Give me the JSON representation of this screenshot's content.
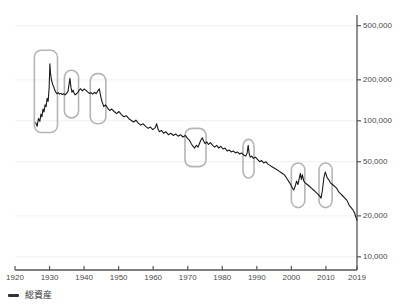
{
  "chart_data": {
    "type": "line",
    "title": "",
    "subtitle": "",
    "xlabel": "",
    "ylabel": "",
    "yscale": "log",
    "xlim": [
      1920,
      2019
    ],
    "ylim": [
      8000,
      560000
    ],
    "grid": true,
    "legend_position": "bottom-left",
    "y_ticks": [
      {
        "value": 500000,
        "label": "500,000"
      },
      {
        "value": 200000,
        "label": "200,000"
      },
      {
        "value": 100000,
        "label": "100,000"
      },
      {
        "value": 50000,
        "label": "50,000"
      },
      {
        "value": 20000,
        "label": "20,000"
      },
      {
        "value": 10000,
        "label": "10,000"
      }
    ],
    "x_ticks": [
      {
        "value": 1920,
        "label": "1920"
      },
      {
        "value": 1930,
        "label": "1930"
      },
      {
        "value": 1940,
        "label": "1940"
      },
      {
        "value": 1950,
        "label": "1950"
      },
      {
        "value": 1960,
        "label": "1960"
      },
      {
        "value": 1970,
        "label": "1970"
      },
      {
        "value": 1980,
        "label": "1980"
      },
      {
        "value": 1990,
        "label": "1990"
      },
      {
        "value": 2000,
        "label": "2000"
      },
      {
        "value": 2010,
        "label": "2010"
      },
      {
        "value": 2019,
        "label": "2019"
      }
    ],
    "series": [
      {
        "name": "総資産",
        "color": "#1a1a1a",
        "x": [
          1926.0,
          1926.4,
          1926.8,
          1927.2,
          1927.5,
          1927.8,
          1928.1,
          1928.4,
          1928.7,
          1929.0,
          1929.3,
          1929.6,
          1929.9,
          1930.1,
          1930.3,
          1930.6,
          1930.9,
          1931.2,
          1931.5,
          1931.8,
          1932.1,
          1932.5,
          1932.9,
          1933.3,
          1933.7,
          1934.1,
          1934.5,
          1934.9,
          1935.3,
          1935.6,
          1935.9,
          1936.2,
          1936.5,
          1936.8,
          1937.1,
          1937.4,
          1937.8,
          1938.2,
          1938.6,
          1939.0,
          1939.5,
          1940.0,
          1940.5,
          1941.0,
          1941.5,
          1942.0,
          1942.5,
          1943.0,
          1943.5,
          1944.0,
          1944.4,
          1944.8,
          1945.2,
          1945.7,
          1946.2,
          1946.8,
          1947.4,
          1948.0,
          1948.7,
          1949.4,
          1950.1,
          1950.8,
          1951.5,
          1952.2,
          1952.9,
          1953.6,
          1954.3,
          1955.0,
          1955.7,
          1956.4,
          1957.1,
          1957.8,
          1958.5,
          1959.2,
          1959.9,
          1960.6,
          1961.0,
          1961.4,
          1961.8,
          1962.4,
          1963.0,
          1963.7,
          1964.4,
          1965.1,
          1965.8,
          1966.5,
          1967.2,
          1967.9,
          1968.6,
          1969.3,
          1970.0,
          1970.5,
          1971.0,
          1971.5,
          1972.0,
          1972.5,
          1973.0,
          1973.4,
          1973.8,
          1974.2,
          1974.6,
          1975.0,
          1975.5,
          1976.0,
          1976.6,
          1977.2,
          1977.8,
          1978.4,
          1979.0,
          1979.6,
          1980.2,
          1980.8,
          1981.4,
          1982.0,
          1982.6,
          1983.2,
          1983.8,
          1984.4,
          1985.0,
          1985.6,
          1986.2,
          1986.8,
          1987.2,
          1987.5,
          1987.8,
          1988.1,
          1988.5,
          1989.0,
          1989.6,
          1990.2,
          1990.8,
          1991.4,
          1992.0,
          1992.6,
          1993.2,
          1993.8,
          1994.4,
          1995.0,
          1995.6,
          1996.2,
          1996.8,
          1997.4,
          1998.0,
          1998.6,
          1999.2,
          1999.8,
          2000.3,
          2000.7,
          2001.1,
          2001.5,
          2001.9,
          2002.3,
          2002.6,
          2002.9,
          2003.2,
          2003.6,
          2004.0,
          2004.6,
          2005.2,
          2005.8,
          2006.4,
          2007.0,
          2007.6,
          2008.2,
          2008.6,
          2009.0,
          2009.4,
          2009.8,
          2010.1,
          2010.4,
          2010.8,
          2011.3,
          2011.9,
          2012.5,
          2013.1,
          2013.7,
          2014.3,
          2014.9,
          2015.5,
          2016.1,
          2016.7,
          2017.3,
          2017.9,
          2018.3,
          2018.7,
          2019.0
        ],
        "y": [
          97000,
          91000,
          104000,
          99000,
          112000,
          107000,
          122000,
          116000,
          131000,
          127000,
          146000,
          139000,
          178000,
          262000,
          221000,
          197000,
          185000,
          178000,
          168000,
          163000,
          158000,
          161000,
          157000,
          159000,
          156000,
          158000,
          155000,
          159000,
          163000,
          182000,
          205000,
          176000,
          162000,
          168000,
          160000,
          155000,
          158000,
          162000,
          168000,
          172000,
          166000,
          171000,
          168000,
          163000,
          159000,
          161000,
          157000,
          162000,
          158000,
          166000,
          172000,
          152000,
          138000,
          127000,
          131000,
          124000,
          119000,
          122000,
          117000,
          113000,
          117000,
          111000,
          107000,
          109000,
          104000,
          101000,
          98000,
          101000,
          96000,
          93000,
          95000,
          91000,
          88000,
          90000,
          86000,
          89000,
          95000,
          87000,
          83000,
          85000,
          81000,
          83000,
          79000,
          81000,
          78000,
          80000,
          77000,
          79000,
          76000,
          78000,
          74000,
          72000,
          68000,
          65000,
          63000,
          66000,
          64000,
          68000,
          72000,
          75000,
          71000,
          68000,
          70000,
          67000,
          69000,
          66000,
          64000,
          66000,
          63000,
          65000,
          62000,
          63000,
          60000,
          61000,
          59000,
          60000,
          58000,
          59000,
          57000,
          58000,
          56000,
          55000,
          58000,
          66000,
          57000,
          54000,
          55000,
          53000,
          54000,
          52000,
          50000,
          51000,
          49000,
          50000,
          48000,
          47000,
          46000,
          45000,
          44000,
          43000,
          42000,
          41000,
          40000,
          38000,
          36000,
          34000,
          32000,
          31000,
          33000,
          36000,
          34000,
          38000,
          41000,
          37000,
          40000,
          36000,
          35000,
          34000,
          33000,
          32000,
          31000,
          30000,
          29000,
          28000,
          27000,
          31000,
          38000,
          42000,
          40000,
          38000,
          37000,
          35000,
          34000,
          33000,
          32000,
          30000,
          29000,
          28000,
          27000,
          26000,
          24000,
          23000,
          22000,
          21000,
          19500,
          18600
        ]
      }
    ],
    "annotations": [
      {
        "name": "highlight-1926-1932",
        "x_start": 1925.6,
        "x_end": 1932.3,
        "y_top": 330000,
        "y_bottom": 82000
      },
      {
        "name": "highlight-1934-1938",
        "x_start": 1934.3,
        "x_end": 1938.4,
        "y_top": 235000,
        "y_bottom": 105000
      },
      {
        "name": "highlight-1942-1946",
        "x_start": 1941.8,
        "x_end": 1946.3,
        "y_top": 222000,
        "y_bottom": 95000
      },
      {
        "name": "highlight-1969-1975",
        "x_start": 1969.2,
        "x_end": 1975.3,
        "y_top": 88000,
        "y_bottom": 46000
      },
      {
        "name": "highlight-1986-1989",
        "x_start": 1986.0,
        "x_end": 1989.2,
        "y_top": 73000,
        "y_bottom": 38000
      },
      {
        "name": "highlight-2000-2004",
        "x_start": 2000.0,
        "x_end": 2003.9,
        "y_top": 49000,
        "y_bottom": 23000
      },
      {
        "name": "highlight-2008-2012",
        "x_start": 2008.0,
        "x_end": 2011.8,
        "y_top": 49000,
        "y_bottom": 23000
      }
    ]
  },
  "legend": {
    "entries": [
      {
        "label": "総資産",
        "color": "#333333"
      }
    ]
  },
  "colors": {
    "line": "#1a1a1a",
    "axis": "#555555",
    "grid": "#f0f0f2",
    "highlight": "#b5b5b5",
    "tick_text": "#4a4a4a"
  }
}
